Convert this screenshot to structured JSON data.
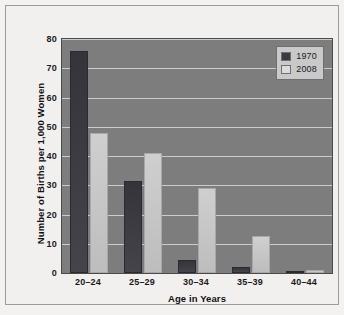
{
  "chart_data": {
    "type": "bar",
    "title": "",
    "xlabel": "Age in Years",
    "ylabel": "Number of Births per 1,000 Women",
    "categories": [
      "20–24",
      "25–29",
      "30–34",
      "35–39",
      "40–44"
    ],
    "series": [
      {
        "name": "1970",
        "color": "#3a3a40",
        "values": [
          76,
          31.5,
          4.5,
          2,
          0.5
        ]
      },
      {
        "name": "2008",
        "color": "#cfcfcf",
        "values": [
          48,
          41,
          29,
          12.5,
          1
        ]
      }
    ],
    "ylim": [
      0,
      80
    ],
    "yticks": [
      0,
      10,
      20,
      30,
      40,
      50,
      60,
      70,
      80
    ],
    "ytick_labels": [
      "0",
      "10",
      "20",
      "30",
      "40",
      "50",
      "60",
      "70",
      "80"
    ],
    "grid": true,
    "legend_position": "top-right",
    "plot_background": "#7d7d7d",
    "figure_background": "#f2f0ee",
    "gridline_color": "#d8d8d8"
  }
}
